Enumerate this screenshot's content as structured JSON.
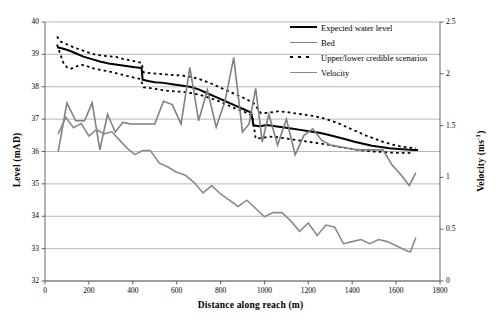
{
  "chart_data": {
    "type": "line",
    "title": "",
    "xlabel": "Distance along reach (m)",
    "ylabel": "Level (mAD)",
    "y2label": "Velocity (ms-1)",
    "xlim": [
      0,
      1800
    ],
    "ylim": [
      32,
      40
    ],
    "y2lim": [
      0,
      2.5
    ],
    "xticks": [
      0,
      200,
      400,
      600,
      800,
      1000,
      1200,
      1400,
      1600,
      1800
    ],
    "xtick_labels": [
      "0",
      "200",
      "400",
      "600",
      "800",
      "1000",
      "1200",
      "1400",
      "1600",
      "1800"
    ],
    "yticks": [
      32,
      33,
      34,
      35,
      36,
      37,
      38,
      39,
      40
    ],
    "ytick_labels": [
      "32",
      "33",
      "34",
      "35",
      "36",
      "37",
      "38",
      "39",
      "40"
    ],
    "y2ticks": [
      0,
      0.5,
      1,
      1.5,
      2,
      2.5
    ],
    "y2tick_labels": [
      "0",
      "0.5",
      "1",
      "1.5",
      "2",
      "2.5"
    ],
    "grid": "horizontal",
    "legend_position": "top-right",
    "series": [
      {
        "name": "Expected water level",
        "axis": "left",
        "style": "solid",
        "color": "#000000",
        "width": 2.0,
        "x": [
          55,
          80,
          110,
          145,
          175,
          210,
          250,
          290,
          330,
          370,
          410,
          440,
          445,
          470,
          500,
          540,
          580,
          620,
          660,
          700,
          740,
          780,
          820,
          860,
          900,
          940,
          950,
          980,
          1010,
          1050,
          1090,
          1130,
          1170,
          1210,
          1250,
          1290,
          1330,
          1370,
          1410,
          1450,
          1490,
          1530,
          1570,
          1610,
          1650,
          1680,
          1700
        ],
        "y": [
          39.22,
          39.18,
          39.12,
          39.02,
          38.93,
          38.86,
          38.78,
          38.72,
          38.68,
          38.64,
          38.6,
          38.58,
          38.22,
          38.18,
          38.14,
          38.12,
          38.08,
          38.04,
          38.0,
          37.92,
          37.8,
          37.68,
          37.56,
          37.44,
          37.32,
          37.2,
          36.8,
          36.78,
          36.82,
          36.78,
          36.74,
          36.7,
          36.66,
          36.62,
          36.58,
          36.52,
          36.45,
          36.38,
          36.3,
          36.24,
          36.18,
          36.14,
          36.1,
          36.08,
          36.06,
          36.05,
          36.05
        ]
      },
      {
        "name": "Upper credible scenario",
        "axis": "left",
        "style": "dotted",
        "color": "#000000",
        "width": 1.8,
        "x": [
          55,
          70,
          90,
          110,
          130,
          155,
          180,
          205,
          235,
          265,
          295,
          325,
          355,
          385,
          415,
          440,
          450,
          480,
          515,
          550,
          590,
          630,
          670,
          710,
          750,
          790,
          830,
          870,
          910,
          950,
          985,
          1020,
          1060,
          1100,
          1140,
          1180,
          1220,
          1260,
          1300,
          1340,
          1380,
          1420,
          1460,
          1500,
          1540,
          1580,
          1620,
          1660,
          1690
        ],
        "y": [
          39.55,
          39.4,
          39.34,
          39.28,
          39.22,
          39.16,
          39.1,
          39.04,
          38.98,
          38.96,
          38.94,
          38.92,
          38.86,
          38.82,
          38.78,
          38.74,
          38.44,
          38.42,
          38.4,
          38.38,
          38.36,
          38.34,
          38.3,
          38.22,
          38.12,
          38.0,
          37.88,
          37.76,
          37.64,
          37.5,
          37.18,
          37.2,
          37.24,
          37.22,
          37.18,
          37.14,
          37.1,
          37.04,
          36.96,
          36.86,
          36.74,
          36.62,
          36.5,
          36.4,
          36.3,
          36.22,
          36.16,
          36.12,
          36.1
        ]
      },
      {
        "name": "Lower credible scenario",
        "axis": "left",
        "style": "dotted",
        "color": "#000000",
        "width": 1.8,
        "x": [
          55,
          70,
          85,
          100,
          115,
          135,
          160,
          185,
          210,
          240,
          270,
          300,
          335,
          370,
          405,
          435,
          450,
          480,
          515,
          550,
          590,
          630,
          670,
          710,
          750,
          790,
          830,
          870,
          910,
          945,
          960,
          990,
          1025,
          1060,
          1100,
          1140,
          1180,
          1220,
          1260,
          1300,
          1340,
          1380,
          1420,
          1460,
          1500,
          1545,
          1590,
          1635,
          1675
        ],
        "y": [
          39.3,
          39.0,
          38.72,
          38.6,
          38.55,
          38.6,
          38.68,
          38.66,
          38.58,
          38.54,
          38.5,
          38.46,
          38.4,
          38.34,
          38.28,
          38.24,
          37.98,
          37.96,
          37.92,
          37.88,
          37.86,
          37.84,
          37.8,
          37.74,
          37.66,
          37.56,
          37.44,
          37.32,
          37.22,
          37.1,
          36.4,
          36.42,
          36.46,
          36.44,
          36.4,
          36.36,
          36.32,
          36.28,
          36.24,
          36.2,
          36.14,
          36.1,
          36.06,
          36.02,
          36.0,
          35.98,
          35.96,
          35.96,
          35.96
        ]
      },
      {
        "name": "Bed",
        "axis": "left",
        "style": "solid",
        "color": "#808080",
        "width": 1.6,
        "x": [
          60,
          100,
          140,
          180,
          215,
          250,
          285,
          320,
          355,
          390,
          425,
          460,
          500,
          540,
          580,
          620,
          660,
          700,
          740,
          780,
          820,
          860,
          900,
          930,
          960,
          990,
          1020,
          1060,
          1100,
          1140,
          1180,
          1220,
          1260,
          1300,
          1340,
          1380,
          1420,
          1460,
          1500,
          1540,
          1580,
          1620,
          1660,
          1690
        ],
        "y": [
          36.0,
          37.5,
          36.95,
          36.95,
          37.5,
          36.05,
          37.15,
          36.6,
          36.9,
          36.85,
          36.85,
          36.85,
          36.85,
          37.55,
          37.45,
          36.85,
          38.6,
          36.95,
          37.9,
          36.75,
          37.55,
          38.9,
          36.6,
          36.85,
          37.95,
          36.3,
          37.15,
          36.2,
          37.0,
          35.9,
          36.5,
          36.7,
          36.35,
          36.2,
          36.15,
          36.1,
          36.05,
          36.05,
          36.05,
          36.05,
          35.6,
          35.3,
          34.95,
          35.35
        ]
      },
      {
        "name": "Velocity",
        "axis": "right",
        "style": "solid",
        "color": "#8a8a8a",
        "width": 1.6,
        "x": [
          60,
          95,
          130,
          165,
          200,
          235,
          270,
          305,
          340,
          375,
          410,
          445,
          480,
          520,
          560,
          600,
          640,
          680,
          720,
          760,
          800,
          840,
          880,
          920,
          960,
          1000,
          1040,
          1080,
          1120,
          1160,
          1200,
          1240,
          1280,
          1320,
          1360,
          1400,
          1440,
          1480,
          1520,
          1560,
          1600,
          1640,
          1665,
          1690
        ],
        "y": [
          1.42,
          1.58,
          1.48,
          1.52,
          1.4,
          1.46,
          1.42,
          1.44,
          1.36,
          1.28,
          1.22,
          1.26,
          1.26,
          1.14,
          1.1,
          1.05,
          1.02,
          0.95,
          0.85,
          0.92,
          0.84,
          0.78,
          0.72,
          0.78,
          0.7,
          0.62,
          0.66,
          0.66,
          0.58,
          0.48,
          0.56,
          0.44,
          0.54,
          0.52,
          0.36,
          0.38,
          0.4,
          0.36,
          0.4,
          0.38,
          0.34,
          0.3,
          0.28,
          0.42
        ]
      }
    ],
    "legend": [
      {
        "label": "Expected water level",
        "style": "solid",
        "color": "#000000"
      },
      {
        "label": "Bed",
        "style": "solid",
        "color": "#808080"
      },
      {
        "label": "Upper/lower credible scenarios",
        "style": "dotted",
        "color": "#000000"
      },
      {
        "label": "Velocity",
        "style": "solid",
        "color": "#8a8a8a"
      }
    ]
  }
}
